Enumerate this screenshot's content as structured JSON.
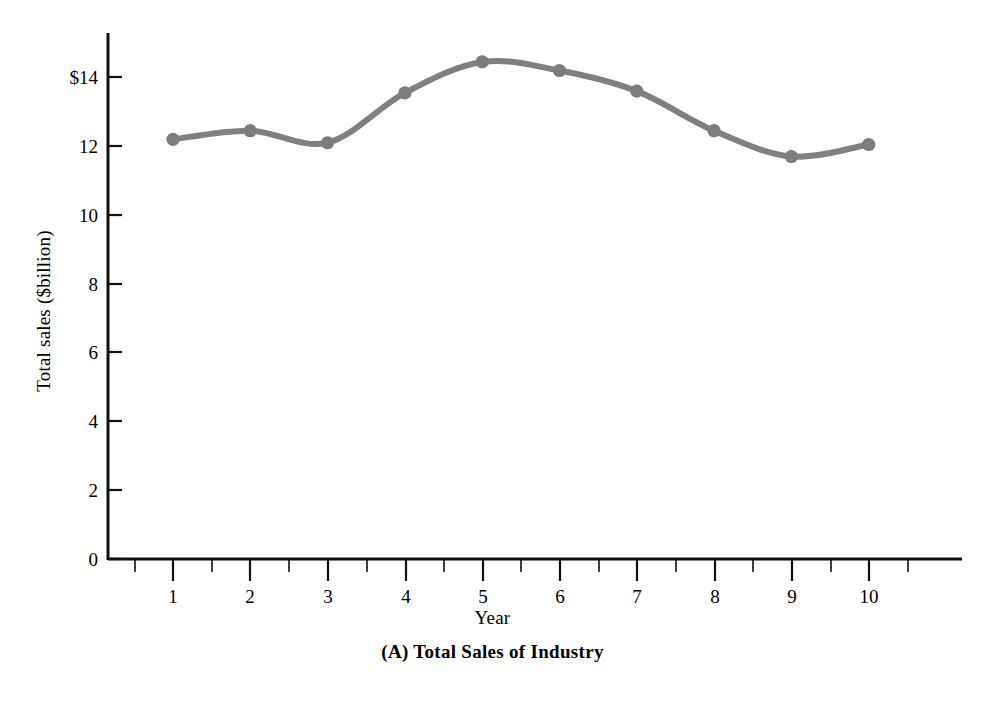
{
  "chart_data": {
    "type": "line",
    "title": "(A) Total Sales of Industry",
    "xlabel": "Year",
    "ylabel": "Total sales ($billion)",
    "x": [
      1,
      2,
      3,
      4,
      5,
      6,
      7,
      8,
      9,
      10
    ],
    "values": [
      12.2,
      12.45,
      12.1,
      13.55,
      14.45,
      14.2,
      13.6,
      12.45,
      11.7,
      12.05
    ],
    "series": [
      {
        "name": "Total sales",
        "values": [
          12.2,
          12.45,
          12.1,
          13.55,
          14.45,
          14.2,
          13.6,
          12.45,
          11.7,
          12.05
        ]
      }
    ],
    "xlim": [
      0,
      11.5
    ],
    "ylim": [
      0,
      15
    ],
    "x_tick_labels": [
      "1",
      "2",
      "3",
      "4",
      "5",
      "6",
      "7",
      "8",
      "9",
      "10"
    ],
    "y_tick_labels": [
      "0",
      "2",
      "4",
      "6",
      "8",
      "10",
      "12",
      "$14"
    ],
    "y_tick_values": [
      0,
      2,
      4,
      6,
      8,
      10,
      12,
      14
    ],
    "grid": false,
    "legend": "none",
    "line_color": "#808080",
    "marker_color": "#7d7d7d",
    "marker_shape": "circle",
    "axis_color": "#111111"
  },
  "figure": {
    "caption": "(A) Total Sales of Industry",
    "x_axis_title": "Year",
    "y_axis_title": "Total sales ($billion)"
  }
}
